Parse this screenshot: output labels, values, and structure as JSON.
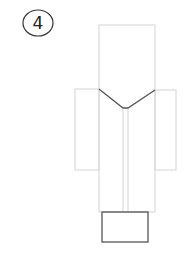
{
  "diagram": {
    "step_number": "4",
    "colors": {
      "light_line": "#d4d4d4",
      "dark_line": "#555555",
      "step_circle": "#333333"
    },
    "parts": {
      "body": {
        "x": 99,
        "y": 25,
        "w": 56,
        "h": 187
      },
      "left_sleeve": {
        "x": 75,
        "y": 89,
        "w": 24,
        "h": 81
      },
      "right_sleeve": {
        "x": 155,
        "y": 90,
        "w": 21,
        "h": 80
      },
      "collar_v": {
        "points": "99,89 126,109 155,90"
      },
      "center_fold_left_x": 123,
      "center_fold_right_x": 128,
      "base_box": {
        "x": 102,
        "y": 212,
        "w": 46,
        "h": 30
      }
    }
  }
}
